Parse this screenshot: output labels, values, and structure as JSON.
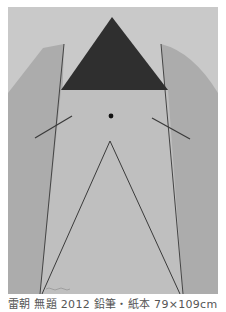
{
  "artwork": {
    "description": "Pencil drawing: dark inverted-triangle-topped figure between two shaded side panels, with central dot, two short diagonal strokes, and a tall thin triangle outline",
    "colors": {
      "paper": "#c8c8c8",
      "panel": "#a9a9a9",
      "triangle": "#2e2e2e",
      "line": "#3a3a3a",
      "column_fill": "#bebebe"
    },
    "signature": "~~~"
  },
  "caption": {
    "text": "雷朝  無題  2012  鉛筆・紙本  79×109cm"
  }
}
